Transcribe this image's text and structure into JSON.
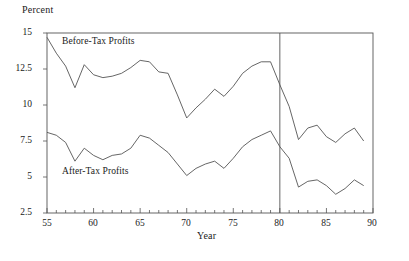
{
  "chart_data": {
    "type": "line",
    "title": "",
    "subtitle": "",
    "ylabel": "Percent",
    "xlabel": "Year",
    "xlim": [
      55,
      90
    ],
    "ylim": [
      2.5,
      15
    ],
    "yticks": [
      2.5,
      5,
      10,
      12.5,
      15
    ],
    "ytick_labels": [
      "2.5",
      "5",
      "7.5",
      "10",
      "12.5",
      "15"
    ],
    "ytick_values": [
      2.5,
      5,
      7.5,
      10,
      12.5,
      15
    ],
    "xticks": [
      55,
      60,
      65,
      70,
      75,
      80,
      85,
      90
    ],
    "xtick_labels": [
      "55",
      "60",
      "65",
      "70",
      "75",
      "80",
      "85",
      "90"
    ],
    "xtick_minor_step": 1,
    "grid": false,
    "legend_position": "inline-annotation",
    "annotations": [
      {
        "name": "before-tax-label",
        "text": "Before-Tax Profits",
        "x": 57.5,
        "y": 14.3
      },
      {
        "name": "after-tax-label",
        "text": "After-Tax Profits",
        "x": 57.5,
        "y": 5.2
      }
    ],
    "vertical_reference_line": {
      "x": 80,
      "color": "#555555"
    },
    "line_color": "#555555",
    "axis_color": "#555555",
    "x": [
      55,
      56,
      57,
      58,
      59,
      60,
      61,
      62,
      63,
      64,
      65,
      66,
      67,
      68,
      69,
      70,
      71,
      72,
      73,
      74,
      75,
      76,
      77,
      78,
      79,
      80,
      81,
      82,
      83,
      84,
      85,
      86,
      87,
      88,
      89
    ],
    "series": [
      {
        "name": "Before-Tax Profits",
        "values": [
          14.7,
          13.6,
          12.7,
          11.2,
          12.8,
          12.1,
          11.9,
          12.0,
          12.2,
          12.6,
          13.1,
          13.0,
          12.3,
          12.2,
          10.7,
          9.1,
          9.8,
          10.4,
          11.1,
          10.6,
          11.3,
          12.2,
          12.7,
          13.0,
          13.0,
          11.4,
          9.9,
          7.6,
          8.4,
          8.6,
          7.8,
          7.4,
          8.0,
          8.4,
          7.5
        ]
      },
      {
        "name": "After-Tax Profits",
        "values": [
          8.1,
          7.9,
          7.4,
          6.1,
          7.0,
          6.5,
          6.2,
          6.5,
          6.6,
          7.0,
          7.9,
          7.7,
          7.2,
          6.7,
          5.9,
          5.1,
          5.6,
          5.9,
          6.1,
          5.6,
          6.3,
          7.1,
          7.6,
          7.9,
          8.2,
          7.1,
          6.3,
          4.3,
          4.7,
          4.8,
          4.4,
          3.8,
          4.2,
          4.8,
          4.4
        ]
      }
    ]
  }
}
